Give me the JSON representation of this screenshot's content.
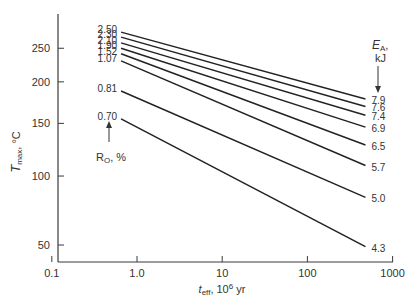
{
  "chart_data": {
    "type": "line",
    "title": "",
    "xlabel": "t_eff, 10^6 yr",
    "xlabel_parts": {
      "main": "t",
      "sub": "eff",
      "rest": ", 10",
      "sup": "6",
      "unit": " yr"
    },
    "ylabel": "T_max, °C",
    "ylabel_parts": {
      "main": "T",
      "sub": "max",
      "unit": ", °C"
    },
    "x_scale": "log",
    "y_scale": "reciprocal-absolute-temperature (1/K)",
    "xlim": [
      0.1,
      1000
    ],
    "ylim": [
      45,
      290
    ],
    "x_ticks": [
      "0.1",
      "1.0",
      "10",
      "100",
      "1000"
    ],
    "y_ticks": [
      "50",
      "100",
      "150",
      "200",
      "250"
    ],
    "grid": false,
    "left_series_header": {
      "label": "R",
      "sub": "O",
      "unit": ", %"
    },
    "right_series_header": {
      "label": "E",
      "sub": "A",
      "line2": "kJ"
    },
    "series": [
      {
        "name": "2.50",
        "ro": "2.50",
        "ea": "7.9",
        "x": [
          0.65,
          480
        ],
        "y": [
          278,
          178
        ]
      },
      {
        "name": "2.30",
        "ro": "2.30",
        "ea": "7.6",
        "x": [
          0.65,
          480
        ],
        "y": [
          269,
          169
        ]
      },
      {
        "name": "2.10",
        "ro": "2.10",
        "ea": "7.4",
        "x": [
          0.65,
          480
        ],
        "y": [
          259,
          159
        ]
      },
      {
        "name": "1.90",
        "ro": "1.90",
        "ea": "6.9",
        "x": [
          0.65,
          480
        ],
        "y": [
          250,
          146
        ]
      },
      {
        "name": "1.52",
        "ro": "1.52",
        "ea": "6.5",
        "x": [
          0.65,
          480
        ],
        "y": [
          241,
          128
        ]
      },
      {
        "name": "1.07",
        "ro": "1.07",
        "ea": "5.7",
        "x": [
          0.65,
          480
        ],
        "y": [
          230,
          109
        ]
      },
      {
        "name": "0.81",
        "ro": "0.81",
        "ea": "5.0",
        "x": [
          0.65,
          480
        ],
        "y": [
          188,
          83
        ]
      },
      {
        "name": "0.70",
        "ro": "0.70",
        "ea": "4.3",
        "x": [
          0.65,
          480
        ],
        "y": [
          155,
          49
        ]
      }
    ]
  }
}
